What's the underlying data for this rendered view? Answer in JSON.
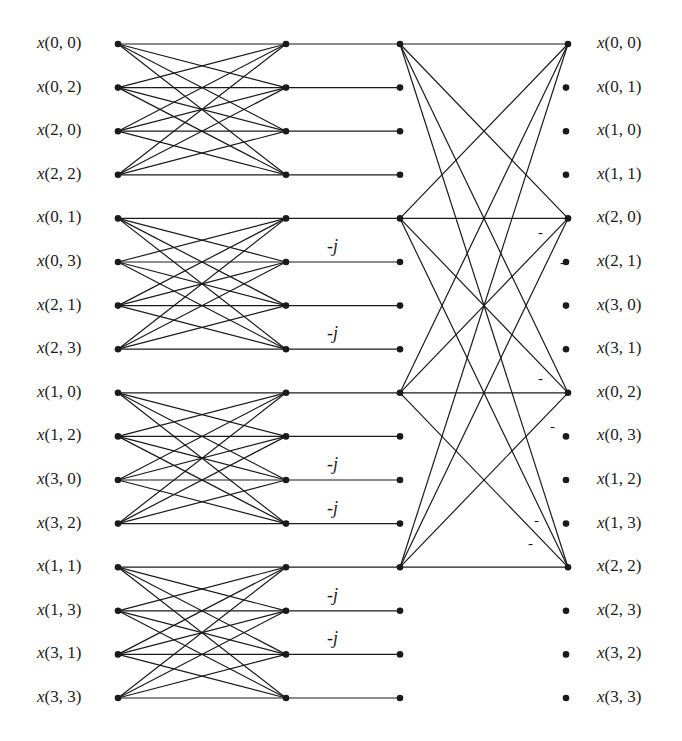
{
  "diagram": {
    "type": "fft-signal-flow-graph",
    "inputs": [
      "x(0, 0)",
      "x(0, 2)",
      "x(2, 0)",
      "x(2, 2)",
      "x(0, 1)",
      "x(0, 3)",
      "x(2, 1)",
      "x(2, 3)",
      "x(1, 0)",
      "x(1, 2)",
      "x(3, 0)",
      "x(3, 2)",
      "x(1, 1)",
      "x(1, 3)",
      "x(3, 1)",
      "x(3, 3)"
    ],
    "outputs": [
      "x(0, 0)",
      "x(0, 1)",
      "x(1, 0)",
      "x(1, 1)",
      "x(2, 0)",
      "x(2, 1)",
      "x(3, 0)",
      "x(3, 1)",
      "x(0, 2)",
      "x(0, 3)",
      "x(1, 2)",
      "x(1, 3)",
      "x(2, 2)",
      "x(2, 3)",
      "x(3, 2)",
      "x(3, 3)"
    ],
    "twiddle_label": "-j",
    "twiddle_rows": [
      5,
      7,
      10,
      11,
      13,
      14
    ],
    "stage3_connected_rows": [
      0,
      4,
      8,
      12
    ],
    "negation_label": "-",
    "negation_marks": [
      {
        "x": 538,
        "y": 232
      },
      {
        "x": 560,
        "y": 262
      },
      {
        "x": 538,
        "y": 378
      },
      {
        "x": 550,
        "y": 426
      },
      {
        "x": 534,
        "y": 520
      },
      {
        "x": 528,
        "y": 543
      }
    ],
    "colors": {
      "line": "#1a1a1a",
      "background": "#ffffff"
    }
  }
}
